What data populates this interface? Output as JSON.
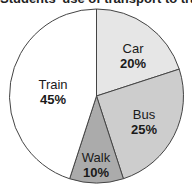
{
  "chart_data": {
    "type": "pie",
    "title": "Students' use of transport to travel to work in L...",
    "categories": [
      "Car",
      "Bus",
      "Walk",
      "Train"
    ],
    "values": [
      20,
      25,
      10,
      45
    ],
    "labels": [
      "20%",
      "25%",
      "10%",
      "45%"
    ],
    "colors": [
      "#e6e6e6",
      "#cdcdcd",
      "#ababab",
      "#ffffff"
    ],
    "start_angle_deg": 0,
    "direction": "clockwise",
    "legend": "none"
  },
  "slices": [
    {
      "name": "Car",
      "pct": "20%"
    },
    {
      "name": "Bus",
      "pct": "25%"
    },
    {
      "name": "Walk",
      "pct": "10%"
    },
    {
      "name": "Train",
      "pct": "45%"
    }
  ]
}
